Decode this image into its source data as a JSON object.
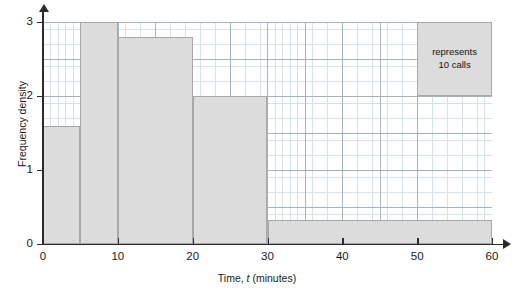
{
  "chart_data": {
    "type": "bar",
    "title": "",
    "xlabel_prefix": "Time, ",
    "xlabel_var": "t",
    "xlabel_suffix": " (minutes)",
    "ylabel": "Frequency density",
    "xlim": [
      0,
      60
    ],
    "ylim": [
      0,
      3
    ],
    "grid": true,
    "grid_minor_step_x": 1,
    "grid_minor_step_y": 0.1,
    "grid_major_step_x": 5,
    "grid_major_step_y": 0.5,
    "legend": {
      "position": "top-right",
      "line1": "represents",
      "line2": "10 calls",
      "width_units": 10,
      "height_units": 1,
      "x_start": 50,
      "x_end": 60,
      "y_bottom": 2,
      "y_top": 3
    },
    "xticks": [
      0,
      10,
      20,
      30,
      40,
      50,
      60
    ],
    "xtick_labels": [
      "0",
      "10",
      "20",
      "30",
      "40",
      "50",
      "60"
    ],
    "yticks": [
      0,
      1,
      2,
      3
    ],
    "ytick_labels": [
      "0",
      "1",
      "2",
      "3"
    ],
    "bars": [
      {
        "name": "bin-0-5",
        "x_start": 0,
        "x_end": 5,
        "height": 1.6,
        "frequency": 80
      },
      {
        "name": "bin-5-10",
        "x_start": 5,
        "x_end": 10,
        "height": 3.0,
        "frequency": 150
      },
      {
        "name": "bin-10-20",
        "x_start": 10,
        "x_end": 20,
        "height": 2.8,
        "frequency": 280
      },
      {
        "name": "bin-20-30",
        "x_start": 20,
        "x_end": 30,
        "height": 2.0,
        "frequency": 200
      },
      {
        "name": "bin-30-60",
        "x_start": 30,
        "x_end": 60,
        "height": 0.32,
        "frequency": 96
      }
    ],
    "colors": {
      "bar_fill": "#dcdcdc",
      "bar_stroke": "#a8a8a8",
      "grid_minor": "#c9d9e4",
      "grid_major": "#9aacb8",
      "axis": "#2b2b2b",
      "background": "#ffffff"
    }
  }
}
